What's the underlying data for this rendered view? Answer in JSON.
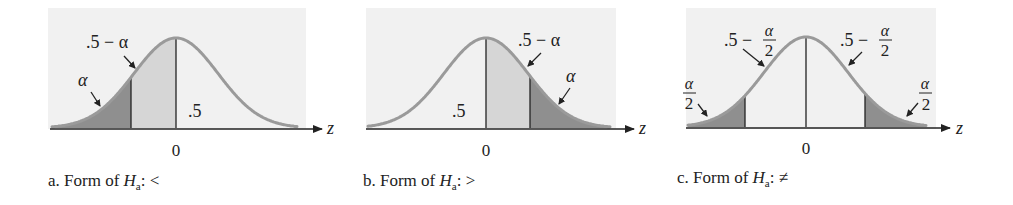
{
  "figure": {
    "panels": [
      {
        "id": "a",
        "caption_prefix": "a. Form of ",
        "caption_var": "H",
        "caption_sub": "a",
        "caption_suffix": ": <",
        "axis_label": "z",
        "zero_label": "0",
        "labels": {
          "alpha": "α",
          "half_minus_alpha": ".5 − α",
          "half": ".5"
        }
      },
      {
        "id": "b",
        "caption_prefix": "b. Form of ",
        "caption_var": "H",
        "caption_sub": "a",
        "caption_suffix": ": >",
        "axis_label": "z",
        "zero_label": "0",
        "labels": {
          "alpha": "α",
          "half_minus_alpha": ".5 − α",
          "half": ".5"
        }
      },
      {
        "id": "c",
        "caption_prefix": "c. Form of ",
        "caption_var": "H",
        "caption_sub": "a",
        "caption_suffix": ": ≠",
        "axis_label": "z",
        "zero_label": "0",
        "labels": {
          "half_minus": ".5 −",
          "alpha": "α",
          "two": "2"
        }
      }
    ],
    "colors": {
      "panel_bg": "#f1f1f1",
      "curve": "#9a9a9a",
      "tail_fill": "#8f8f8f",
      "middle_fill": "#d6d6d6",
      "axis": "#222222"
    }
  }
}
